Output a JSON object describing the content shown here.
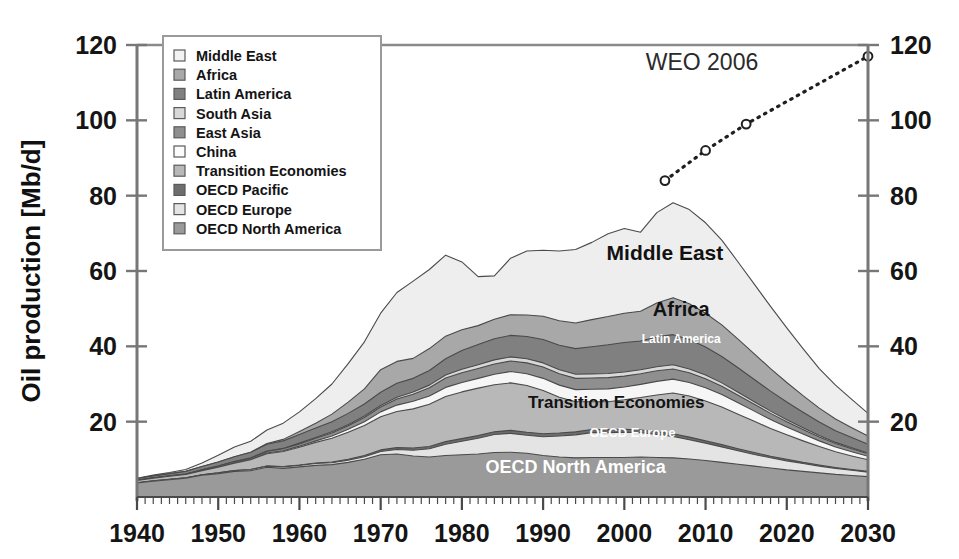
{
  "chart_data": {
    "type": "area",
    "title": "",
    "xlabel": "",
    "ylabel": "Oil production [Mb/d]",
    "xlim": [
      1940,
      2030
    ],
    "ylim": [
      0,
      120
    ],
    "xticks": [
      1940,
      1950,
      1960,
      1970,
      1980,
      1990,
      2000,
      2010,
      2020,
      2030
    ],
    "yticks": [
      0,
      20,
      40,
      60,
      80,
      100,
      120
    ],
    "y_axis_right": true,
    "grid": false,
    "stacked": true,
    "legend_position": "top-left-inside",
    "x": [
      1940,
      1942,
      1944,
      1946,
      1948,
      1950,
      1952,
      1954,
      1956,
      1958,
      1960,
      1962,
      1964,
      1966,
      1968,
      1970,
      1972,
      1974,
      1976,
      1978,
      1980,
      1982,
      1984,
      1986,
      1988,
      1990,
      1992,
      1994,
      1996,
      1998,
      2000,
      2002,
      2004,
      2006,
      2008,
      2010,
      2012,
      2014,
      2016,
      2018,
      2020,
      2022,
      2024,
      2026,
      2028,
      2030
    ],
    "stack_order_bottom_to_top": [
      "OECD North America",
      "OECD Europe",
      "OECD Pacific",
      "Transition Economies",
      "China",
      "East Asia",
      "South Asia",
      "Latin America",
      "Africa",
      "Middle East"
    ],
    "series": [
      {
        "name": "Middle East",
        "color": "#eeeeee",
        "values": [
          0.1,
          0.2,
          0.3,
          0.5,
          0.9,
          1.8,
          2.6,
          2.9,
          3.6,
          4.3,
          5.2,
          6.5,
          8.0,
          10.2,
          12.5,
          15.0,
          18.3,
          20.5,
          21.0,
          21.5,
          18.0,
          13.0,
          11.5,
          15.0,
          17.0,
          17.5,
          18.5,
          19.5,
          20.5,
          22.0,
          22.5,
          21.0,
          24.0,
          25.2,
          25.0,
          24.0,
          22.5,
          20.5,
          18.5,
          16.5,
          14.5,
          12.5,
          10.5,
          9.0,
          7.5,
          6.0
        ]
      },
      {
        "name": "Africa",
        "color": "#a8a8a8",
        "values": [
          0.0,
          0.0,
          0.0,
          0.0,
          0.0,
          0.0,
          0.0,
          0.0,
          0.2,
          0.4,
          0.8,
          1.3,
          2.0,
          3.0,
          4.0,
          6.0,
          5.8,
          5.3,
          5.8,
          6.0,
          5.5,
          5.0,
          5.2,
          5.5,
          5.7,
          6.2,
          6.5,
          6.8,
          7.2,
          7.5,
          7.8,
          7.9,
          9.0,
          9.8,
          9.5,
          9.0,
          8.4,
          7.6,
          6.8,
          6.0,
          5.2,
          4.4,
          3.7,
          3.1,
          2.6,
          2.2
        ]
      },
      {
        "name": "Latin America",
        "color": "#808080",
        "values": [
          0.4,
          0.5,
          0.6,
          0.7,
          0.9,
          1.1,
          1.3,
          1.5,
          1.8,
          2.0,
          2.3,
          2.5,
          2.7,
          3.0,
          3.2,
          3.5,
          3.7,
          3.6,
          3.9,
          4.3,
          5.0,
          5.4,
          5.6,
          5.7,
          5.9,
          6.2,
          6.5,
          6.8,
          7.2,
          7.6,
          7.8,
          7.6,
          7.9,
          8.0,
          7.8,
          7.4,
          7.0,
          6.5,
          5.9,
          5.3,
          4.7,
          4.1,
          3.6,
          3.1,
          2.7,
          2.3
        ]
      },
      {
        "name": "South Asia",
        "color": "#d8d8d8",
        "values": [
          0.0,
          0.0,
          0.0,
          0.0,
          0.0,
          0.0,
          0.0,
          0.1,
          0.1,
          0.1,
          0.2,
          0.2,
          0.3,
          0.3,
          0.4,
          0.4,
          0.5,
          0.6,
          0.7,
          0.8,
          0.9,
          1.0,
          1.1,
          1.1,
          1.1,
          1.1,
          1.1,
          1.1,
          1.1,
          1.1,
          1.1,
          1.1,
          1.1,
          1.1,
          1.0,
          1.0,
          0.9,
          0.8,
          0.7,
          0.6,
          0.5,
          0.5,
          0.4,
          0.3,
          0.3,
          0.2
        ]
      },
      {
        "name": "East Asia",
        "color": "#8f8f8f",
        "values": [
          0.1,
          0.1,
          0.1,
          0.1,
          0.2,
          0.2,
          0.3,
          0.3,
          0.4,
          0.5,
          0.6,
          0.7,
          0.8,
          0.9,
          1.1,
          1.3,
          1.6,
          1.9,
          2.2,
          2.5,
          2.6,
          2.6,
          2.7,
          2.8,
          2.9,
          3.0,
          3.0,
          3.0,
          3.0,
          3.0,
          2.9,
          2.8,
          2.8,
          2.7,
          2.6,
          2.4,
          2.2,
          2.0,
          1.8,
          1.6,
          1.4,
          1.2,
          1.0,
          0.9,
          0.8,
          0.7
        ]
      },
      {
        "name": "China",
        "color": "#f6f6f6",
        "values": [
          0.0,
          0.0,
          0.0,
          0.0,
          0.0,
          0.1,
          0.1,
          0.1,
          0.2,
          0.2,
          0.3,
          0.4,
          0.6,
          0.8,
          1.0,
          1.3,
          1.7,
          2.0,
          2.2,
          2.4,
          2.5,
          2.6,
          2.8,
          3.0,
          3.1,
          3.2,
          3.2,
          3.2,
          3.3,
          3.4,
          3.4,
          3.5,
          3.6,
          3.7,
          3.6,
          3.5,
          3.3,
          3.0,
          2.7,
          2.4,
          2.1,
          1.8,
          1.5,
          1.3,
          1.1,
          0.9
        ]
      },
      {
        "name": "Transition Economies",
        "color": "#b8b8b8",
        "values": [
          0.6,
          0.7,
          0.8,
          0.9,
          1.1,
          1.5,
          2.0,
          2.6,
          3.3,
          4.0,
          4.7,
          5.5,
          6.3,
          7.2,
          8.0,
          8.8,
          9.6,
          10.4,
          11.2,
          12.0,
          12.4,
          12.6,
          12.5,
          12.6,
          12.4,
          11.5,
          9.5,
          8.0,
          7.4,
          7.4,
          7.8,
          8.6,
          9.8,
          10.8,
          10.9,
          10.6,
          10.0,
          9.2,
          8.3,
          7.4,
          6.5,
          5.7,
          4.9,
          4.2,
          3.6,
          3.1
        ]
      },
      {
        "name": "OECD Pacific",
        "color": "#6e6e6e",
        "values": [
          0.0,
          0.0,
          0.0,
          0.0,
          0.0,
          0.0,
          0.0,
          0.0,
          0.0,
          0.1,
          0.1,
          0.1,
          0.2,
          0.2,
          0.3,
          0.4,
          0.5,
          0.6,
          0.6,
          0.7,
          0.7,
          0.7,
          0.7,
          0.8,
          0.8,
          0.8,
          0.8,
          0.8,
          0.8,
          0.8,
          0.8,
          0.7,
          0.7,
          0.7,
          0.7,
          0.6,
          0.6,
          0.5,
          0.5,
          0.4,
          0.4,
          0.3,
          0.3,
          0.2,
          0.2,
          0.2
        ]
      },
      {
        "name": "OECD Europe",
        "color": "#e4e4e4",
        "values": [
          0.1,
          0.1,
          0.1,
          0.1,
          0.1,
          0.2,
          0.2,
          0.3,
          0.3,
          0.4,
          0.4,
          0.5,
          0.5,
          0.6,
          0.7,
          0.9,
          1.2,
          1.5,
          2.2,
          3.0,
          3.6,
          4.2,
          4.8,
          5.0,
          4.8,
          5.0,
          5.6,
          6.1,
          6.6,
          6.6,
          6.7,
          6.5,
          6.1,
          5.7,
          5.1,
          4.6,
          4.1,
          3.6,
          3.1,
          2.7,
          2.4,
          2.1,
          1.8,
          1.6,
          1.4,
          1.2
        ]
      },
      {
        "name": "OECD North America",
        "color": "#9a9a9a",
        "values": [
          3.7,
          4.2,
          4.6,
          5.0,
          5.8,
          6.2,
          6.8,
          7.0,
          7.9,
          7.6,
          8.0,
          8.4,
          8.6,
          9.2,
          10.0,
          11.2,
          11.4,
          10.9,
          10.6,
          11.0,
          11.2,
          11.4,
          11.8,
          11.9,
          11.6,
          11.0,
          10.6,
          10.4,
          10.5,
          10.5,
          10.5,
          10.6,
          10.5,
          10.4,
          10.1,
          9.7,
          9.2,
          8.7,
          8.2,
          7.7,
          7.2,
          6.8,
          6.4,
          6.0,
          5.7,
          5.4
        ]
      }
    ],
    "overlay_line": {
      "name": "WEO 2006",
      "label": "WEO 2006",
      "style": "dotted",
      "marker": "circle-open",
      "x": [
        2005,
        2010,
        2015,
        2030
      ],
      "y": [
        84,
        92,
        99,
        117
      ]
    },
    "inline_labels": [
      {
        "text": "Middle East",
        "x": 2005,
        "y": 63,
        "color": "dark",
        "size": 21
      },
      {
        "text": "Africa",
        "x": 2007,
        "y": 48,
        "color": "dark",
        "size": 20
      },
      {
        "text": "Latin America",
        "x": 2007,
        "y": 41,
        "color": "light",
        "size": 12
      },
      {
        "text": "Transition Economies",
        "x": 1999,
        "y": 23.5,
        "color": "dark",
        "size": 17
      },
      {
        "text": "OECD Europe",
        "x": 2001,
        "y": 16,
        "color": "light",
        "size": 13
      },
      {
        "text": "OECD North America",
        "x": 1994,
        "y": 6.5,
        "color": "light",
        "size": 18
      }
    ]
  },
  "legend": {
    "items": [
      {
        "label": "Middle East",
        "color": "#f2f2f2"
      },
      {
        "label": "Africa",
        "color": "#a8a8a8"
      },
      {
        "label": "Latin America",
        "color": "#808080"
      },
      {
        "label": "South Asia",
        "color": "#d8d8d8"
      },
      {
        "label": "East Asia",
        "color": "#8f8f8f"
      },
      {
        "label": "China",
        "color": "#fbfbfb"
      },
      {
        "label": "Transition Economies",
        "color": "#b8b8b8"
      },
      {
        "label": "OECD Pacific",
        "color": "#6e6e6e"
      },
      {
        "label": "OECD Europe",
        "color": "#e4e4e4"
      },
      {
        "label": "OECD North America",
        "color": "#9a9a9a"
      }
    ]
  },
  "axes": {
    "y_label": "Oil production [Mb/d]",
    "y_ticks_left": [
      "120",
      "100",
      "80",
      "60",
      "40",
      "20"
    ],
    "y_ticks_right": [
      "120",
      "100",
      "80",
      "60",
      "40",
      "20"
    ],
    "x_ticks": [
      "1940",
      "1950",
      "1960",
      "1970",
      "1980",
      "1990",
      "2000",
      "2010",
      "2020",
      "2030"
    ]
  },
  "annotations": {
    "weo": "WEO 2006"
  }
}
